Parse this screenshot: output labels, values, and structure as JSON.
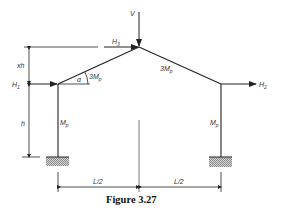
{
  "figure": {
    "caption": "Figure 3.27",
    "labels": {
      "V": "V",
      "H1": "H",
      "H1_sub": "1",
      "H2": "H",
      "H2_sub": "2",
      "H3": "H",
      "H3_sub": "3",
      "xh": "xh",
      "h": "h",
      "alpha": "α",
      "rafter_left_moment": "3M",
      "rafter_left_sub": "p",
      "rafter_right_moment": "3M",
      "rafter_right_sub": "p",
      "column_left_moment": "M",
      "column_left_sub": "p",
      "column_right_moment": "M",
      "column_right_sub": "p",
      "span_left": "L/2",
      "span_right": "L/2"
    },
    "colors": {
      "line": "#222222",
      "hatch": "#999999"
    }
  }
}
